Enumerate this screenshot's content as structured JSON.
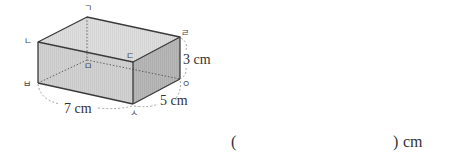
{
  "figure": {
    "type": "rectangular-prism",
    "vertices": {
      "top_back_left": "ㄱ",
      "top_front_left": "ㄴ",
      "top_front_right": "ㄷ",
      "top_back_right": "ㄹ",
      "bottom_back_left": "ㅁ",
      "bottom_front_left": "ㅂ",
      "bottom_front_right": "ㅅ",
      "bottom_back_right": "ㅇ"
    },
    "dimensions": {
      "length": "7 cm",
      "width": "5 cm",
      "height": "3 cm"
    },
    "colors": {
      "front_face": "#cfcfcf",
      "top_face": "#dcdcdc",
      "side_face": "#b5b5b5",
      "edge": "#3a3a3a",
      "hidden_edge": "#555555",
      "dimension_arc": "#9a9a9a"
    }
  },
  "answer": {
    "open_paren": "(",
    "close_paren": ")",
    "unit": "cm",
    "value": ""
  }
}
